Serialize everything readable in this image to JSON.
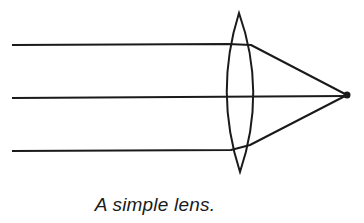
{
  "figure": {
    "caption": "A simple lens.",
    "colors": {
      "stroke": "#1a1a1a",
      "background": "#ffffff"
    },
    "lens": {
      "top": [
        239,
        13
      ],
      "bottom": [
        240,
        172
      ],
      "left_x": 223,
      "right_x": 257
    },
    "focal_point": [
      347,
      95
    ],
    "rays": [
      {
        "name": "top-ray",
        "start": [
          12,
          45
        ],
        "enter": [
          228,
          44
        ],
        "exit": [
          251,
          45
        ]
      },
      {
        "name": "center-ray",
        "start": [
          12,
          98
        ],
        "enter": [
          223,
          97
        ],
        "exit": [
          257,
          97
        ]
      },
      {
        "name": "bottom-ray",
        "start": [
          12,
          151
        ],
        "enter": [
          231,
          150
        ],
        "exit": [
          250,
          145
        ]
      }
    ]
  }
}
